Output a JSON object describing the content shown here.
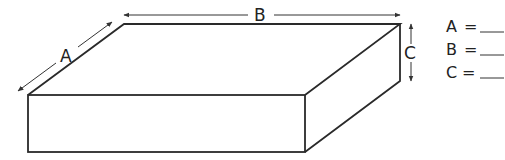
{
  "figure": {
    "type": "rectangular-prism",
    "dimension_labels": {
      "a": "A",
      "b": "B",
      "c": "C"
    }
  },
  "answers": [
    {
      "label": "A",
      "equals": "=",
      "value": ""
    },
    {
      "label": "B",
      "equals": "=",
      "value": ""
    },
    {
      "label": "C",
      "equals": "=",
      "value": ""
    }
  ],
  "colors": {
    "stroke": "#2a2a2a",
    "background": "#ffffff"
  }
}
